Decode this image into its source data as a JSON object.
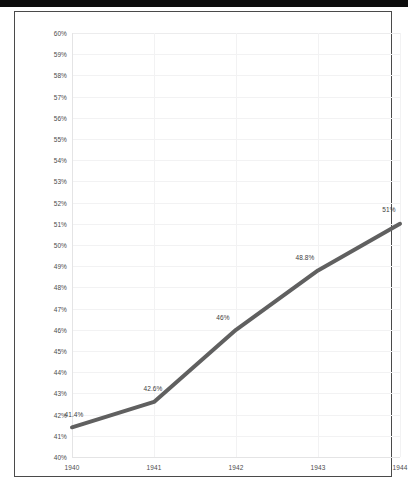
{
  "chart_data": {
    "type": "line",
    "title": "",
    "xlabel": "",
    "ylabel": "",
    "categories": [
      "1940",
      "1941",
      "1942",
      "1943",
      "1944"
    ],
    "x": [
      1940,
      1941,
      1942,
      1943,
      1944
    ],
    "values": [
      41.4,
      42.6,
      46.0,
      48.8,
      51.0
    ],
    "point_labels": [
      "41.4%",
      "42.6%",
      "46%",
      "48.8%",
      "51%"
    ],
    "series": [
      {
        "name": "",
        "values": [
          41.4,
          42.6,
          46.0,
          48.8,
          51.0
        ]
      }
    ],
    "ylim": [
      40,
      60
    ],
    "xlim": [
      1940,
      1944
    ],
    "ytick_labels": [
      "60%",
      "59%",
      "58%",
      "57%",
      "56%",
      "55%",
      "54%",
      "53%",
      "52%",
      "51%",
      "50%",
      "49%",
      "48%",
      "47%",
      "46%",
      "45%",
      "44%",
      "43%",
      "42%",
      "41%",
      "40%"
    ],
    "ytick_values": [
      60,
      59,
      58,
      57,
      56,
      55,
      54,
      53,
      52,
      51,
      50,
      49,
      48,
      47,
      46,
      45,
      44,
      43,
      42,
      41,
      40
    ],
    "xtick_labels": [
      "1940",
      "1941",
      "1942",
      "1943",
      "1944"
    ],
    "grid": true,
    "legend": false,
    "legend_position": "none",
    "line_color": "#606060",
    "background_color": "#ffffff",
    "grid_color": "#f2f2f3",
    "tick_label_color": "#4c4c4c"
  }
}
